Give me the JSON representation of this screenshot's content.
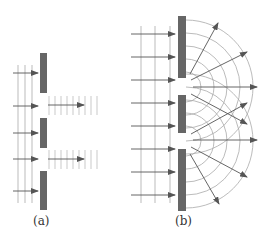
{
  "figure": {
    "panels": [
      {
        "id": "a",
        "label": "(a)",
        "description": "Plane waves passing through two narrow slits without diffraction (wavelength much smaller than slit)",
        "barrier_color": "#666666",
        "wave_color": "#999999",
        "arrow_color": "#555555"
      },
      {
        "id": "b",
        "label": "(b)",
        "description": "Plane waves diffracting through two slits producing circular wavefronts that overlap",
        "barrier_color": "#666666",
        "wave_color": "#999999",
        "arrow_color": "#555555"
      }
    ]
  }
}
